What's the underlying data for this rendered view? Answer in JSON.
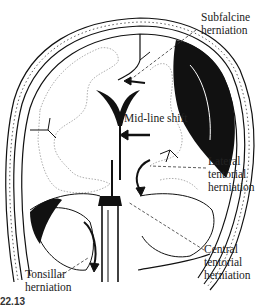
{
  "figure": {
    "labels": {
      "subfalcine": [
        "Subfalcine",
        "herniation"
      ],
      "midline": [
        "Mid-line shift"
      ],
      "lateral_tentorial": [
        "Lateral",
        "tentorial",
        "herniation"
      ],
      "central_tentorial": [
        "Central",
        "tentorial",
        "herniation"
      ],
      "tonsillar": [
        "Tonsillar",
        "herniation"
      ]
    },
    "caption": {
      "number": "22.13",
      "text": "Diagram of herniation types (caption truncated)"
    },
    "colors": {
      "ink": "#111111",
      "background": "#ffffff",
      "dotted": "#888888"
    }
  }
}
